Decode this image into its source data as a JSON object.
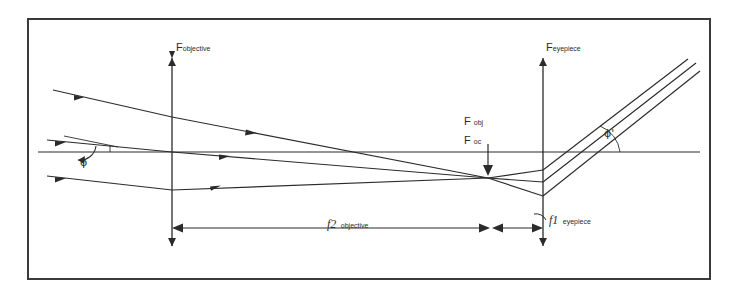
{
  "figure": {
    "type": "optical-ray-diagram",
    "border_color": "#3a3a3a",
    "line_color": "#2b2b2b",
    "background_color": "#ffffff"
  },
  "labels": {
    "objective_axis": {
      "symbol": "F",
      "subscript": "objective",
      "x": 178,
      "y": 48
    },
    "eyepiece_axis": {
      "symbol": "F",
      "subscript": "eyepiece",
      "x": 548,
      "y": 48
    },
    "focal_obj": {
      "symbol": "F",
      "subscript": "obj",
      "x": 466,
      "y": 121
    },
    "focal_oc": {
      "symbol": "F",
      "subscript": "oc",
      "x": 466,
      "y": 140
    },
    "angle_in": {
      "symbol": "ϕ",
      "x": 83,
      "y": 158
    },
    "angle_out": {
      "symbol": "ϕ'",
      "x": 607,
      "y": 134
    },
    "dim_objective": {
      "symbol": "f",
      "subscript": "2",
      "name": "objective",
      "x": 340,
      "y": 221
    },
    "dim_eyepiece": {
      "symbol": "f",
      "subscript": "1",
      "name": "eyepiece",
      "x": 551,
      "y": 216
    }
  },
  "geometry": {
    "optical_axis_y": 152,
    "objective_axis_x": 172,
    "eyepiece_axis_x": 543,
    "focal_point_x": 488,
    "focal_point_y": 178,
    "axis_top_y": 56,
    "axis_bottom_y": 248,
    "dimension_line_y": 228,
    "frame": {
      "x": 27,
      "y": 18,
      "w": 684,
      "h": 262
    }
  },
  "rays": {
    "incoming_count": 3,
    "outgoing_count": 3,
    "incoming_tilt": "downward to the right",
    "outgoing_tilt": "upward to the right"
  }
}
